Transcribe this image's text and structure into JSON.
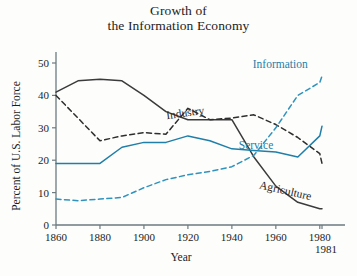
{
  "figure": {
    "title_lines": [
      "Growth of",
      "the Information Economy"
    ],
    "background_color": "#fdfdfc"
  },
  "colors": {
    "agriculture": "#3b3b3b",
    "industry": "#2e2e2e",
    "service": "#1f7fa8",
    "information": "#2f93bd",
    "axis": "#6d7a80",
    "text": "#1c1c1c"
  },
  "chart_data": {
    "type": "line",
    "title": "Growth of the Information Economy",
    "xlabel": "Year",
    "ylabel": "Percent of U.S. Labor Force",
    "xlim": [
      1860,
      1985
    ],
    "ylim": [
      0,
      53
    ],
    "xticks": [
      1860,
      1880,
      1900,
      1920,
      1940,
      1960,
      1980,
      1981
    ],
    "xtick_labels": [
      "1860",
      "1880",
      "1900",
      "1920",
      "1940",
      "1960",
      "1980",
      "1981"
    ],
    "yticks": [
      0,
      10,
      20,
      30,
      40,
      50
    ],
    "ytick_labels": [
      "0",
      "10",
      "20",
      "30",
      "40",
      "50"
    ],
    "grid": false,
    "legend": "inline-annotations",
    "x": [
      1860,
      1870,
      1880,
      1890,
      1900,
      1910,
      1920,
      1930,
      1940,
      1950,
      1960,
      1970,
      1980,
      1981
    ],
    "series": [
      {
        "name": "Agriculture",
        "style": "solid",
        "color": "#3b3b3b",
        "label_x": 1964,
        "label_y": 9.5,
        "label_rotation": 13,
        "values": [
          41,
          44.5,
          45,
          44.5,
          40,
          35,
          32.5,
          32.5,
          32.5,
          21,
          12,
          7,
          5,
          5
        ]
      },
      {
        "name": "Industry",
        "style": "dashed",
        "color": "#2e2e2e",
        "label_x": 1919,
        "label_y": 33.5,
        "label_rotation": -8,
        "values": [
          40,
          33,
          26,
          27.5,
          28.5,
          28,
          36,
          32.5,
          33,
          34,
          31,
          27,
          22,
          19
        ]
      },
      {
        "name": "Service",
        "style": "solid",
        "color": "#1f7fa8",
        "label_x": 1951,
        "label_y": 23.5,
        "label_rotation": 0,
        "values": [
          19,
          19,
          19,
          24,
          25.5,
          25.5,
          27.5,
          26,
          23.5,
          23,
          22.5,
          21,
          27.5,
          30.5
        ]
      },
      {
        "name": "Information",
        "style": "dashed",
        "color": "#2f93bd",
        "label_x": 1962,
        "label_y": 48.5,
        "label_rotation": 0,
        "values": [
          8,
          7.5,
          8,
          8.5,
          11.5,
          14,
          15.5,
          16.5,
          18,
          21.5,
          30,
          40,
          44,
          46
        ]
      }
    ]
  }
}
